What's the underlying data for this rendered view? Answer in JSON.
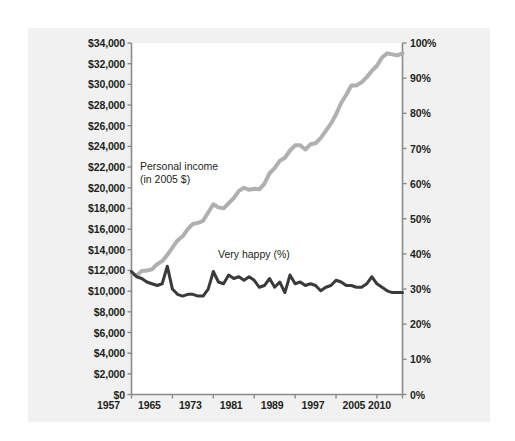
{
  "figure": {
    "background_color": "#ffffff",
    "panel_color": "#f1f1f1",
    "plot_color": "#ffffff"
  },
  "annotations": {
    "income_label": "Personal income\n(in 2005 $)",
    "happy_label": "Very happy (%)"
  },
  "chart_data": {
    "type": "line",
    "title": "",
    "subtitle": "",
    "xlabel": "",
    "ylabel": "",
    "grid": false,
    "legend_position": "inline-annotation",
    "x": [
      1957,
      1958,
      1959,
      1960,
      1961,
      1962,
      1963,
      1964,
      1965,
      1966,
      1967,
      1968,
      1969,
      1970,
      1971,
      1972,
      1973,
      1974,
      1975,
      1976,
      1977,
      1978,
      1979,
      1980,
      1981,
      1982,
      1983,
      1984,
      1985,
      1986,
      1987,
      1988,
      1989,
      1990,
      1991,
      1992,
      1993,
      1994,
      1995,
      1996,
      1997,
      1998,
      1999,
      2000,
      2001,
      2002,
      2003,
      2004,
      2005,
      2006,
      2007,
      2008,
      2009,
      2010
    ],
    "xlim": [
      1957,
      2010
    ],
    "xticks": [
      1957,
      1965,
      1973,
      1981,
      1989,
      1997,
      2005,
      2010
    ],
    "xticklabels": [
      "1957",
      "1965",
      "1973",
      "1981",
      "1989",
      "1997",
      "2005",
      "2010"
    ],
    "axes": [
      {
        "id": "left",
        "name": "Personal income (in 2005 $)",
        "side": "left",
        "ylim": [
          0,
          34000
        ],
        "yticks": [
          0,
          2000,
          4000,
          6000,
          8000,
          10000,
          12000,
          14000,
          16000,
          18000,
          20000,
          22000,
          24000,
          26000,
          28000,
          30000,
          32000,
          34000
        ],
        "yticklabels": [
          "$0",
          "$2,000",
          "$4,000",
          "$6,000",
          "$8,000",
          "$10,000",
          "$12,000",
          "$14,000",
          "$16,000",
          "$18,000",
          "$20,000",
          "$22,000",
          "$24,000",
          "$26,000",
          "$28,000",
          "$30,000",
          "$32,000",
          "$34,000"
        ]
      },
      {
        "id": "right",
        "name": "Very happy (%)",
        "side": "right",
        "ylim": [
          0,
          100
        ],
        "yticks": [
          0,
          10,
          20,
          30,
          40,
          50,
          60,
          70,
          80,
          90,
          100
        ],
        "yticklabels": [
          "0%",
          "10%",
          "20%",
          "30%",
          "40%",
          "50%",
          "60%",
          "70%",
          "80%",
          "90%",
          "100%"
        ]
      }
    ],
    "series": [
      {
        "name": "Personal income (in 2005 $)",
        "axis": "left",
        "color": "#b0b0b0",
        "linewidth": 4,
        "values": [
          11700,
          11500,
          11950,
          12000,
          12100,
          12600,
          12900,
          13500,
          14200,
          14900,
          15300,
          16000,
          16500,
          16600,
          16800,
          17600,
          18400,
          18100,
          18000,
          18500,
          19000,
          19700,
          20000,
          19800,
          19900,
          19850,
          20400,
          21400,
          21900,
          22600,
          22900,
          23600,
          24100,
          24100,
          23700,
          24200,
          24300,
          24800,
          25500,
          26200,
          27100,
          28200,
          29000,
          29900,
          29900,
          30200,
          30700,
          31300,
          31800,
          32600,
          33000,
          32900,
          32800,
          33000
        ]
      },
      {
        "name": "Very happy (%)",
        "axis": "right",
        "color": "#3a3a3a",
        "linewidth": 3,
        "values": [
          35.0,
          33.5,
          33.0,
          32.0,
          31.5,
          31.0,
          31.5,
          36.5,
          30.0,
          28.5,
          28.0,
          28.5,
          28.5,
          28.0,
          28.0,
          30.0,
          35.0,
          32.0,
          31.5,
          34.0,
          33.0,
          33.5,
          32.5,
          33.5,
          32.5,
          30.5,
          31.0,
          33.0,
          30.5,
          32.0,
          29.0,
          34.0,
          31.5,
          32.0,
          31.0,
          31.5,
          31.0,
          29.5,
          30.5,
          31.0,
          32.5,
          32.0,
          31.0,
          31.0,
          30.5,
          30.5,
          31.5,
          33.5,
          31.5,
          30.5,
          29.5,
          29.0,
          29.0,
          29.0
        ]
      }
    ]
  }
}
